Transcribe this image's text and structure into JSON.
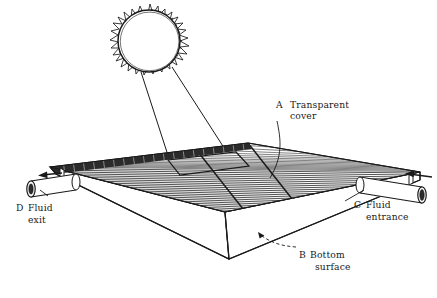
{
  "figure": {
    "background_color": "#ffffff",
    "ink_color": "#1a1a1a"
  },
  "labels": {
    "cover": {
      "key": "A",
      "line1": "Transparent",
      "line2": "cover"
    },
    "bottom": {
      "key": "B",
      "line1": "Bottom",
      "line2": "surface"
    },
    "entrance": {
      "key": "C",
      "line1": "Fluid",
      "line2": "entrance"
    },
    "exit": {
      "key": "D",
      "line1": "Fluid",
      "line2": "exit"
    }
  },
  "parts": {
    "sun": "sun-icon",
    "sun_rays": "solar-ray-arrow",
    "collector": "collector-box",
    "absorber": "corrugated-absorber-surface",
    "inlet_pipe": "inlet-pipe",
    "outlet_pipe": "outlet-pipe",
    "inlet_arrow": "flow-arrow-in",
    "outlet_arrow": "flow-arrow-out"
  }
}
